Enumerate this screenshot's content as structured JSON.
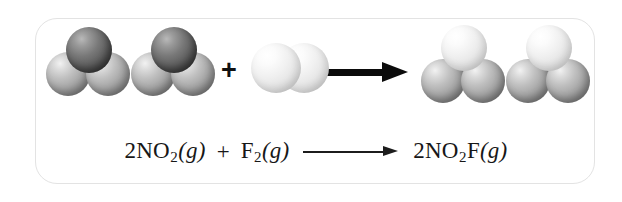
{
  "figure": {
    "panel_border_color": "#e3e3e3",
    "background_color": "#ffffff"
  },
  "chart_data": {
    "type": "diagram",
    "subtype": "chemical-reaction-space-filling-model",
    "reaction_operator": "+",
    "reaction_arrow": "→",
    "reactants": [
      {
        "formula": "NO2",
        "coefficient": 2,
        "state": "g",
        "model_count": 2,
        "geometry": "bent",
        "atoms": [
          {
            "element": "N",
            "count": 1,
            "color": "#5c5c5c",
            "label": "nitrogen",
            "position": "top-center"
          },
          {
            "element": "O",
            "count": 2,
            "color": "#a3a3a3",
            "label": "oxygen",
            "position": "lower-left, lower-right"
          }
        ]
      },
      {
        "formula": "F2",
        "coefficient": 1,
        "state": "g",
        "model_count": 1,
        "geometry": "linear-diatomic",
        "atoms": [
          {
            "element": "F",
            "count": 2,
            "color": "#e8e8e8",
            "label": "fluorine",
            "position": "side-by-side"
          }
        ]
      }
    ],
    "products": [
      {
        "formula": "NO2F",
        "coefficient": 2,
        "state": "g",
        "model_count": 2,
        "geometry": "trigonal-planar",
        "atoms": [
          {
            "element": "F",
            "count": 1,
            "color": "#e8e8e8",
            "label": "fluorine",
            "position": "top-center"
          },
          {
            "element": "N",
            "count": 1,
            "color": "#5c5c5c",
            "label": "nitrogen",
            "position": "center"
          },
          {
            "element": "O",
            "count": 2,
            "color": "#a3a3a3",
            "label": "oxygen",
            "position": "lower-left, lower-right"
          }
        ]
      }
    ],
    "legend": []
  },
  "models": {
    "no2_1_label": "nitrogen-dioxide-molecule-1",
    "no2_2_label": "nitrogen-dioxide-molecule-2",
    "f2_label": "fluorine-molecule",
    "no2f_1_label": "nitryl-fluoride-molecule-1",
    "no2f_2_label": "nitryl-fluoride-molecule-2"
  },
  "operators": {
    "plus": "+",
    "arrow_symbol": "→"
  },
  "equation": {
    "reactant_1": {
      "coefficient_and_symbol": "2NO",
      "subscript": "2",
      "state": "(g)"
    },
    "plus": "+",
    "reactant_2": {
      "coefficient_and_symbol": "F",
      "subscript": "2",
      "state": "(g)"
    },
    "arrow": "⟶",
    "product": {
      "coefficient_and_symbol": "2NO",
      "subscript": "2",
      "symbol_tail": "F",
      "state": "(g)"
    },
    "full_text": "2NO2(g) + F2(g) ⟶ 2NO2F(g)"
  }
}
